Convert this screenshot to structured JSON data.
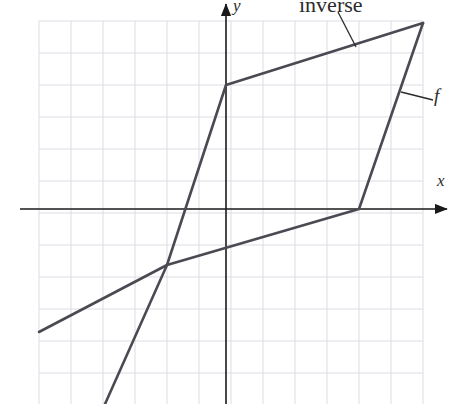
{
  "figure": {
    "kind": "coordinate-graph",
    "background_color": "#ffffff",
    "width": 455,
    "height": 404
  },
  "labels": {
    "inverse": "inverse",
    "f": "f",
    "y_axis": "y",
    "x_axis": "x"
  },
  "chart_data": {
    "type": "line",
    "title": "",
    "subtitle": "",
    "xlabel": "x",
    "ylabel": "y",
    "grid": true,
    "grid_color": "#d8d8e2",
    "grid_spacing_px": 32,
    "legend_position": "annotation-callouts",
    "axis_color": "#1a1a1a",
    "curve_color": "#4a4a52",
    "origin_px": {
      "x": 226,
      "y": 209
    },
    "unit_px": 32,
    "xlim": [
      -5.85,
      6.9
    ],
    "ylim": [
      -6.1,
      6.5
    ],
    "annotations": [
      {
        "text": "inverse",
        "label_px": {
          "x": 299,
          "y": -6
        },
        "leader_from_px": {
          "x": 338,
          "y": 12
        },
        "leader_to_px": {
          "x": 356,
          "y": 47
        }
      },
      {
        "text": "f",
        "label_px": {
          "x": 434,
          "y": 86
        },
        "leader_from_px": {
          "x": 433,
          "y": 100
        },
        "leader_to_px": {
          "x": 401,
          "y": 92
        }
      }
    ],
    "series": [
      {
        "name": "f",
        "description": "steep piecewise-linear increasing function",
        "points_px": [
          {
            "x": 105,
            "y": 404
          },
          {
            "x": 167,
            "y": 265
          },
          {
            "x": 226,
            "y": 85
          },
          {
            "x": 423,
            "y": 23
          }
        ],
        "points_units": [
          {
            "x": -3.78,
            "y": -6.09
          },
          {
            "x": -1.84,
            "y": 1.37
          },
          {
            "x": 0.0,
            "y": 3.88
          },
          {
            "x": 6.16,
            "y": 5.81
          }
        ]
      },
      {
        "name": "inverse",
        "description": "shallow piecewise-linear increasing function, reflection of f",
        "points_px": [
          {
            "x": 39,
            "y": 332
          },
          {
            "x": 167,
            "y": 265
          },
          {
            "x": 359,
            "y": 209
          },
          {
            "x": 423,
            "y": 23
          }
        ],
        "points_units": [
          {
            "x": -5.84,
            "y": -3.84
          },
          {
            "x": -1.84,
            "y": -1.75
          },
          {
            "x": 4.16,
            "y": 0.0
          },
          {
            "x": 6.16,
            "y": 5.81
          }
        ]
      }
    ],
    "gridlines_x_px": [
      39,
      71,
      103,
      135,
      167,
      199,
      231,
      263,
      295,
      327,
      359,
      391,
      423
    ],
    "gridlines_y_px": [
      21,
      53,
      85,
      117,
      149,
      181,
      213,
      245,
      277,
      309,
      341,
      373
    ],
    "x_axis_px": {
      "y": 209,
      "from_x": 20,
      "to_x": 447
    },
    "y_axis_px": {
      "x": 226,
      "from_y": 404,
      "to_y": 4
    }
  }
}
